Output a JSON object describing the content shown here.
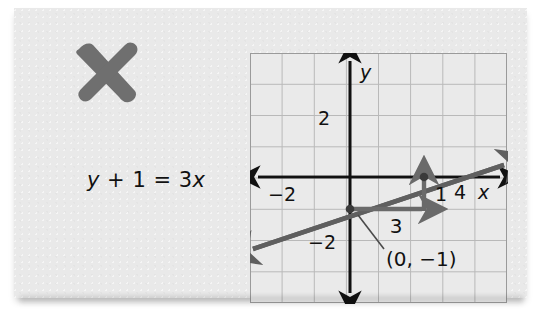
{
  "card": {
    "background_color": "#e9e9e9"
  },
  "annotation": {
    "mark": "x-cross-mark",
    "mark_color": "#6b6b6b"
  },
  "equation": {
    "full": "y + 1 = 3x",
    "lhs_var": "y",
    "lhs_rest": " + 1 = 3",
    "rhs_var": "x"
  },
  "chart_data": {
    "type": "line",
    "title": "",
    "xlabel": "x",
    "ylabel": "y",
    "xlim": [
      -4,
      4
    ],
    "ylim": [
      -4,
      4
    ],
    "grid": true,
    "grid_step": 1,
    "axis_color": "#111111",
    "grid_color": "#b9b9b9",
    "line_color": "#555555",
    "slope_arrow_color": "#666666",
    "series": [
      {
        "name": "y = 3x - 1",
        "equation": "y + 1 = 3x",
        "slope": 3,
        "intercept": -1,
        "drawn_slope_visual": 0.333,
        "points": [
          {
            "x": 0,
            "y": -1,
            "label": "(0, −1)",
            "marked": true
          },
          {
            "x": 3,
            "y": 0,
            "label": "",
            "marked": true
          }
        ]
      }
    ],
    "tick_labels": [
      {
        "axis": "y",
        "value": 2,
        "text": "2"
      },
      {
        "axis": "y",
        "value": -2,
        "text": "−2"
      },
      {
        "axis": "x",
        "value": -2,
        "text": "−2"
      },
      {
        "axis": "x",
        "value": 4,
        "text": "4"
      }
    ],
    "axis_labels": [
      {
        "name": "y-axis-label",
        "text": "y"
      },
      {
        "name": "x-axis-label",
        "text": "x"
      }
    ],
    "annotations": [
      {
        "name": "run-label",
        "text": "3",
        "meaning": "horizontal run"
      },
      {
        "name": "rise-label",
        "text": "1",
        "meaning": "vertical rise"
      },
      {
        "name": "intercept-callout",
        "text": "(0, −1)",
        "meaning": "y-intercept point"
      }
    ]
  }
}
